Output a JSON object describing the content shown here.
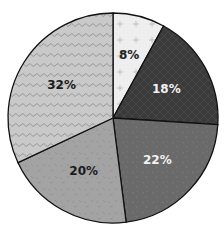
{
  "chart_data": {
    "type": "pie",
    "title": "",
    "slices": [
      {
        "label": "8%",
        "value": 8,
        "color": "#eeeeee",
        "pattern": "plus-dots",
        "text_color": "#222222"
      },
      {
        "label": "18%",
        "value": 18,
        "color": "#3a3a3a",
        "pattern": "crosshatch",
        "text_color": "#f2f2f2"
      },
      {
        "label": "22%",
        "value": 22,
        "color": "#6a6a6a",
        "pattern": "speckle",
        "text_color": "#f2f2f2"
      },
      {
        "label": "20%",
        "value": 20,
        "color": "#a3a3a3",
        "pattern": "dashes",
        "text_color": "#1a1a1a"
      },
      {
        "label": "32%",
        "value": 32,
        "color": "#c9c9c9",
        "pattern": "squiggle",
        "text_color": "#1a1a1a"
      }
    ],
    "start_angle_deg": 0,
    "direction": "clockwise",
    "legend": "none",
    "labels": [
      "8%",
      "18%",
      "22%",
      "20%",
      "32%"
    ],
    "values": [
      8,
      18,
      22,
      20,
      32
    ]
  }
}
